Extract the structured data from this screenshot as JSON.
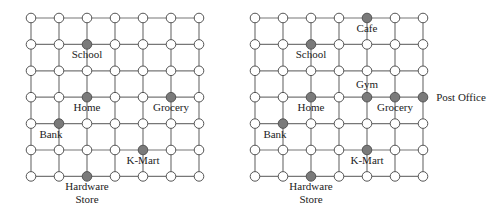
{
  "maps": [
    {
      "name": "map-left",
      "grid": {
        "cols": 7,
        "rows": 7,
        "x0": 31,
        "y0": 18,
        "dx": 28,
        "dy": 26.4
      },
      "locations": [
        {
          "label": "School",
          "col": 3,
          "row": 2,
          "lx": 0,
          "ly": 14
        },
        {
          "label": "Home",
          "col": 3,
          "row": 4,
          "lx": 0,
          "ly": 14
        },
        {
          "label": "Grocery",
          "col": 6,
          "row": 4,
          "lx": 0,
          "ly": 14
        },
        {
          "label": "Bank",
          "col": 2,
          "row": 5,
          "lx": -8,
          "ly": 14
        },
        {
          "label": "K-Mart",
          "col": 5,
          "row": 6,
          "lx": 0,
          "ly": 14
        },
        {
          "label": "Hardware|Store",
          "col": 3,
          "row": 7,
          "lx": 0,
          "ly": 14
        }
      ]
    },
    {
      "name": "map-right",
      "grid": {
        "cols": 7,
        "rows": 7,
        "x0": 255,
        "y0": 18,
        "dx": 28,
        "dy": 26.4
      },
      "locations": [
        {
          "label": "Cafe",
          "col": 5,
          "row": 1,
          "lx": 0,
          "ly": 14
        },
        {
          "label": "School",
          "col": 3,
          "row": 2,
          "lx": 0,
          "ly": 14
        },
        {
          "label": "Gym",
          "col": 5,
          "row": 4,
          "lx": 0,
          "ly": -9
        },
        {
          "label": "Home",
          "col": 3,
          "row": 4,
          "lx": 0,
          "ly": 14
        },
        {
          "label": "Grocery",
          "col": 6,
          "row": 4,
          "lx": 0,
          "ly": 14
        },
        {
          "label": "Post Office",
          "col": 7,
          "row": 4,
          "lx": 38,
          "ly": 4
        },
        {
          "label": "Bank",
          "col": 2,
          "row": 5,
          "lx": -8,
          "ly": 14
        },
        {
          "label": "K-Mart",
          "col": 5,
          "row": 6,
          "lx": 0,
          "ly": 14
        },
        {
          "label": "Hardware|Store",
          "col": 3,
          "row": 7,
          "lx": 0,
          "ly": 14
        }
      ]
    }
  ],
  "colors": {
    "line": "#777777",
    "node_fill": "#ffffff",
    "node_stroke": "#555555",
    "marked_fill": "#7a7a7a"
  }
}
